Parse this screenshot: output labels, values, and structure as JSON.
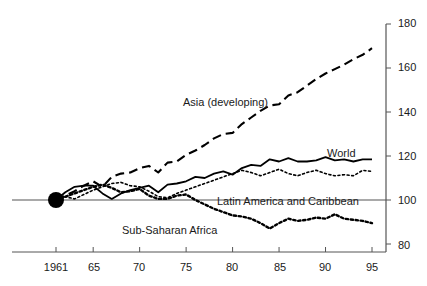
{
  "chart_data": {
    "type": "line",
    "title": "",
    "subtitle": "",
    "xlabel": "",
    "ylabel": "",
    "xlim": [
      1961,
      1995.6
    ],
    "ylim": [
      80,
      180
    ],
    "grid": false,
    "legend_position": "inline-annotations",
    "baseline": 100,
    "origin_marker": {
      "x": 1961,
      "y": 100,
      "style": "filled-circle"
    },
    "x_ticks": [
      1961,
      65,
      70,
      75,
      80,
      85,
      90,
      95
    ],
    "x_tick_labels": [
      "1961",
      "65",
      "70",
      "75",
      "80",
      "85",
      "90",
      "95"
    ],
    "y_ticks": [
      80,
      100,
      120,
      140,
      160,
      180
    ],
    "y_tick_labels": [
      "80",
      "100",
      "120",
      "140",
      "160",
      "180"
    ],
    "x": [
      1961,
      1962,
      1963,
      1964,
      1965,
      1966,
      1967,
      1968,
      1969,
      1970,
      1971,
      1972,
      1973,
      1974,
      1975,
      1976,
      1977,
      1978,
      1979,
      1980,
      1981,
      1982,
      1983,
      1984,
      1985,
      1986,
      1987,
      1988,
      1989,
      1990,
      1991,
      1992,
      1993,
      1994,
      1995
    ],
    "series": [
      {
        "name": "Asia (developing)",
        "style": "dashed",
        "color": "#000000",
        "label_x": 1969.5,
        "label_y": 142,
        "values": [
          100,
          102,
          104,
          106.5,
          108.5,
          106,
          110.5,
          112,
          112.5,
          114.5,
          115.5,
          112.5,
          117,
          117.5,
          120.5,
          122.5,
          125,
          128,
          130,
          130.5,
          134.5,
          137.5,
          140.5,
          143,
          143.5,
          147.5,
          149,
          152,
          155,
          157.5,
          159.5,
          161.5,
          164,
          166,
          169
        ]
      },
      {
        "name": "World",
        "style": "solid",
        "color": "#000000",
        "label_x": 1989.5,
        "label_y": 124,
        "values": [
          100,
          103.5,
          106,
          106.5,
          106.5,
          103,
          100.5,
          103,
          104.5,
          105.5,
          106.5,
          103.5,
          107,
          107.5,
          108.5,
          110.5,
          110,
          112,
          113,
          111.5,
          114.5,
          116,
          115.5,
          118.5,
          117.5,
          119,
          117.5,
          117.5,
          118,
          119.5,
          118,
          118.5,
          117.5,
          118.5,
          118.5
        ]
      },
      {
        "name": "Latin America and Caribbean",
        "style": "dotted",
        "color": "#000000",
        "label_x": 1977.5,
        "label_y": 101,
        "values": [
          100,
          101.5,
          100.5,
          102.5,
          104.5,
          106,
          107.5,
          108,
          106.5,
          106,
          104,
          101.5,
          101,
          103,
          104.5,
          106,
          107.5,
          109,
          110.5,
          112,
          113.5,
          112.5,
          111,
          112.5,
          114,
          112,
          111,
          112.5,
          113.5,
          112,
          111,
          111.5,
          111,
          113.5,
          113
        ]
      },
      {
        "name": "Sub-Saharan Africa",
        "style": "dotted-thick",
        "color": "#000000",
        "label_x": 1968,
        "label_y": 93,
        "values": [
          100,
          101.5,
          103,
          104.5,
          106,
          107,
          105.5,
          103.5,
          104,
          105,
          102,
          100.5,
          100.5,
          102,
          102.5,
          100,
          98,
          96,
          94.5,
          93,
          92.5,
          91.5,
          89.5,
          87,
          89.5,
          91.5,
          90.5,
          91,
          92,
          91.5,
          93.5,
          91.5,
          91,
          90.5,
          89.5
        ]
      }
    ]
  },
  "axis": {
    "y_axis_side": "right",
    "x_axis_side": "bottom"
  }
}
